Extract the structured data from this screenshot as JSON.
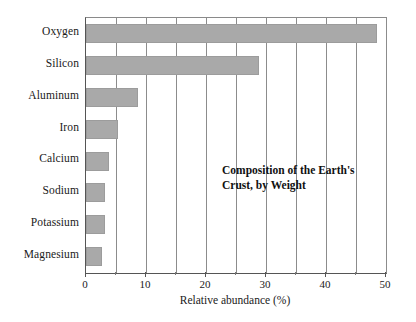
{
  "chart_data": {
    "type": "bar",
    "orientation": "horizontal",
    "title": "",
    "annotation_lines": [
      "Composition of the Earth's",
      "Crust, by Weight"
    ],
    "categories": [
      "Oxygen",
      "Silicon",
      "Aluminum",
      "Iron",
      "Calcium",
      "Sodium",
      "Potassium",
      "Magnesium"
    ],
    "values": [
      48.5,
      28.8,
      8.7,
      5.3,
      3.8,
      3.2,
      3.2,
      2.7
    ],
    "xlabel": "Relative abundance (%)",
    "ylabel": "",
    "xlim": [
      0,
      50
    ],
    "xticks": [
      0,
      10,
      20,
      30,
      40,
      50
    ],
    "xtick_labels": [
      "0",
      "10",
      "20",
      "30",
      "40",
      "50"
    ],
    "minor_tick_step": 5,
    "grid": "vertical",
    "legend": "none",
    "bar_color": "#a9a9a9",
    "axis_color": "#555555",
    "grid_color": "#8c8c8c"
  }
}
